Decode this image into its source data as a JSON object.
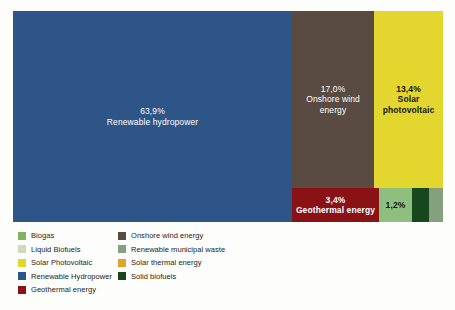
{
  "chart_data": {
    "type": "treemap",
    "title": "",
    "xlabel": "",
    "ylabel": "",
    "unit": "percent",
    "legend_position": "bottom-left",
    "grid": false,
    "categories": [
      "Renewable hydropower",
      "Onshore wind energy",
      "Solar photovoltaic",
      "Geothermal energy",
      "Biogas",
      "Solid biofuels",
      "Renewable municipal waste"
    ],
    "values": [
      63.9,
      17.0,
      13.4,
      3.4,
      1.2,
      null,
      null
    ],
    "labels": [
      "63,9%",
      "17,0%",
      "13,4%",
      "3,4%",
      "1,2%",
      "",
      ""
    ],
    "tiles": [
      {
        "id": "hydro",
        "name": "Renewable hydropower",
        "pct_label": "63,9%",
        "value": 63.9,
        "color": "#2d5588",
        "text_color": "#ffffff"
      },
      {
        "id": "wind",
        "name": "Onshore wind energy",
        "pct_label": "17,0%",
        "value": 17.0,
        "color": "#594b42",
        "text_color": "#ffffff"
      },
      {
        "id": "solarpv",
        "name": "Solar photovoltaic",
        "pct_label": "13,4%",
        "value": 13.4,
        "color": "#e3d62e",
        "text_color": "#15140f"
      },
      {
        "id": "geothermal",
        "name": "Geothermal energy",
        "pct_label": "3,4%",
        "value": 3.4,
        "color": "#8a1114",
        "text_color": "#ffffff"
      },
      {
        "id": "biogas",
        "name": "Biogas",
        "pct_label": "1,2%",
        "value": 1.2,
        "color": "#8fbf7e",
        "text_color": "#15140f"
      },
      {
        "id": "solid-biofuels",
        "name": "Solid biofuels",
        "pct_label": "",
        "value": null,
        "color": "#17481d",
        "text_color": "#ffffff"
      },
      {
        "id": "renewable-municipal-waste",
        "name": "Renewable municipal waste",
        "pct_label": "",
        "value": null,
        "color": "#85a07c",
        "text_color": "#15140f"
      }
    ]
  },
  "legend": {
    "left_column": [
      {
        "label": "Biogas",
        "color": "#7eb55e"
      },
      {
        "label": "Liquid Biofuels",
        "color": "#cdd8bf"
      },
      {
        "label": "Solar Photovoltaic",
        "color": "#e3d62e"
      },
      {
        "label": "Renewable Hydropower",
        "color": "#2d5588"
      },
      {
        "label": "Geothermal energy",
        "color": "#8a1114"
      }
    ],
    "right_column": [
      {
        "label": "Onshore wind energy",
        "color": "#594b42"
      },
      {
        "label": "Renewable municipal waste",
        "color": "#85a07c"
      },
      {
        "label": "Solar thermal energy",
        "color": "#e0a429"
      },
      {
        "label": "Solid biofuels",
        "color": "#17481d"
      }
    ]
  }
}
